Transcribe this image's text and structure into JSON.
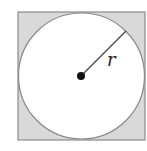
{
  "diagram": {
    "square": {
      "x": 18,
      "y": 12,
      "size": 127,
      "fill": "#d9d9d9",
      "stroke": "#8a8a8a"
    },
    "circle": {
      "cx": 81.5,
      "cy": 76,
      "r": 63,
      "fill": "#ffffff",
      "stroke": "#8a8a8a"
    },
    "center_dot": {
      "cx": 81,
      "cy": 76,
      "r": 4,
      "fill": "#111111"
    },
    "radius_line": {
      "x1": 81,
      "y1": 76,
      "x2": 126,
      "y2": 31
    },
    "radius_label": "r"
  }
}
